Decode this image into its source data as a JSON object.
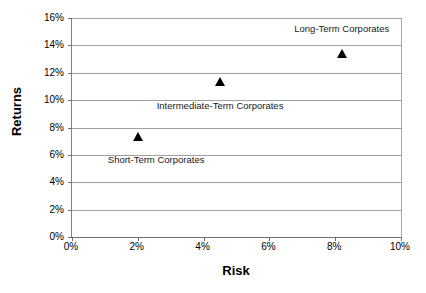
{
  "chart_data": {
    "type": "scatter",
    "title": "",
    "xlabel": "Risk",
    "ylabel": "Returns",
    "xlim": [
      0,
      10
    ],
    "ylim": [
      0,
      16
    ],
    "x_tick_labels": [
      "0%",
      "2%",
      "4%",
      "6%",
      "8%",
      "10%"
    ],
    "x_tick_values": [
      0,
      2,
      4,
      6,
      8,
      10
    ],
    "y_tick_labels": [
      "0%",
      "2%",
      "4%",
      "6%",
      "8%",
      "10%",
      "12%",
      "14%",
      "16%"
    ],
    "y_tick_values": [
      0,
      2,
      4,
      6,
      8,
      10,
      12,
      14,
      16
    ],
    "grid": "horizontal",
    "legend": "none",
    "marker_shape": "triangle",
    "marker_color": "#000000",
    "points": [
      {
        "label": "Short-Term Corporates",
        "x": 2.0,
        "y": 7.3,
        "annotation_x": 2.0,
        "annotation_y": 5.6,
        "annotation_align": "left"
      },
      {
        "label": "Intermediate-Term Corporates",
        "x": 4.5,
        "y": 11.3,
        "annotation_x": 4.5,
        "annotation_y": 9.6,
        "annotation_align": "center"
      },
      {
        "label": "Long-Term Corporates",
        "x": 8.2,
        "y": 13.4,
        "annotation_x": 8.2,
        "annotation_y": 15.2,
        "annotation_align": "center"
      }
    ]
  }
}
